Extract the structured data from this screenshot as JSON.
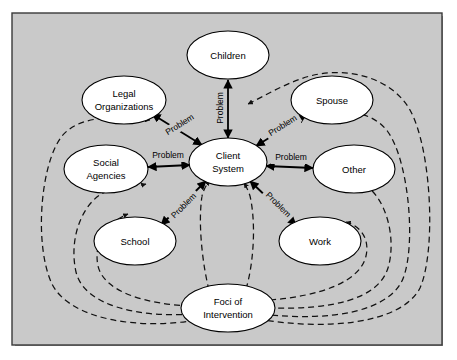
{
  "figure": {
    "name": "ecomap-client-system",
    "background_color": "#c9c9c9",
    "border_color": "#3a3a3a",
    "node_fill": "#ffffff",
    "node_stroke": "#000000",
    "solid_edge_color": "#000000",
    "dashed_edge_color": "#111111"
  },
  "nodes": [
    {
      "id": "children",
      "label": "Children",
      "cx": 228,
      "cy": 55,
      "rx": 41,
      "ry": 24,
      "lines": [
        "Children"
      ]
    },
    {
      "id": "legal",
      "label": "Legal Organizations",
      "cx": 124,
      "cy": 100,
      "rx": 41,
      "ry": 24,
      "lines": [
        "Legal",
        "Organizations"
      ]
    },
    {
      "id": "spouse",
      "label": "Spouse",
      "cx": 332,
      "cy": 100,
      "rx": 41,
      "ry": 24,
      "lines": [
        "Spouse"
      ]
    },
    {
      "id": "social",
      "label": "Social Agencies",
      "cx": 106,
      "cy": 169,
      "rx": 41,
      "ry": 24,
      "lines": [
        "Social",
        "Agencies"
      ]
    },
    {
      "id": "client",
      "label": "Client System",
      "cx": 228,
      "cy": 162,
      "rx": 38,
      "ry": 24,
      "lines": [
        "Client",
        "System"
      ]
    },
    {
      "id": "other",
      "label": "Other",
      "cx": 354,
      "cy": 169,
      "rx": 41,
      "ry": 24,
      "lines": [
        "Other"
      ]
    },
    {
      "id": "school",
      "label": "School",
      "cx": 135,
      "cy": 241,
      "rx": 41,
      "ry": 24,
      "lines": [
        "School"
      ]
    },
    {
      "id": "work",
      "label": "Work",
      "cx": 320,
      "cy": 241,
      "rx": 41,
      "ry": 24,
      "lines": [
        "Work"
      ]
    },
    {
      "id": "foci",
      "label": "Foci of Intervention",
      "cx": 228,
      "cy": 308,
      "rx": 46,
      "ry": 24,
      "lines": [
        "Foci of",
        "Intervention"
      ]
    }
  ],
  "edges": [
    {
      "id": "client-children",
      "from": "client",
      "to": "children",
      "label": "Problem",
      "label_x": 221,
      "label_y": 108,
      "label_rot": -90
    },
    {
      "id": "client-legal",
      "from": "client",
      "to": "legal",
      "label": "Problem",
      "label_x": 180,
      "label_y": 125,
      "label_rot": -38
    },
    {
      "id": "client-spouse",
      "from": "client",
      "to": "spouse",
      "label": "Problem",
      "label_x": 283,
      "label_y": 126,
      "label_rot": -38
    },
    {
      "id": "client-social",
      "from": "client",
      "to": "social",
      "label": "Problem",
      "label_x": 167,
      "label_y": 158,
      "label_rot": 0
    },
    {
      "id": "client-other",
      "from": "client",
      "to": "other",
      "label": "Problem",
      "label_x": 293,
      "label_y": 160,
      "label_rot": 0
    },
    {
      "id": "client-school",
      "from": "client",
      "to": "school",
      "label": "Problem",
      "label_x": 182,
      "label_y": 208,
      "label_rot": 47
    },
    {
      "id": "client-work",
      "from": "client",
      "to": "work",
      "label": "Problem",
      "label_x": 279,
      "label_y": 207,
      "label_rot": -55
    }
  ],
  "foci_links": [
    {
      "id": "foci-client-left",
      "target": "client-system-left"
    },
    {
      "id": "foci-client-right",
      "target": "client-system-right"
    },
    {
      "id": "foci-social",
      "target": "social-agencies"
    },
    {
      "id": "foci-legal",
      "target": "legal-organizations"
    },
    {
      "id": "foci-school",
      "target": "school"
    },
    {
      "id": "foci-children",
      "target": "children-link"
    },
    {
      "id": "foci-spouse",
      "target": "spouse"
    },
    {
      "id": "foci-other",
      "target": "other"
    },
    {
      "id": "foci-work",
      "target": "work"
    }
  ],
  "legend": {
    "solid_meaning": "Problem",
    "dashed_meaning": "Foci of Intervention"
  }
}
